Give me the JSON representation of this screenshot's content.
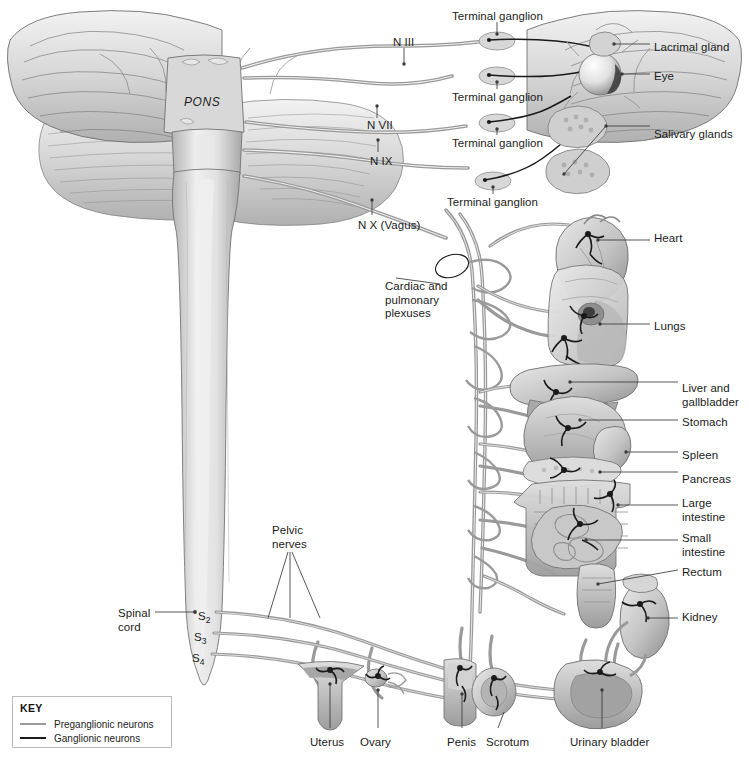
{
  "figure": {
    "background": "#ffffff"
  },
  "brain": {
    "pons_label": "PONS"
  },
  "cranial_nerves": [
    {
      "label": "N III",
      "x": 393,
      "y": 36,
      "tick": "down"
    },
    {
      "label": "N VII",
      "x": 367,
      "y": 119,
      "tick": "up"
    },
    {
      "label": "N IX",
      "x": 370,
      "y": 155,
      "tick": "up"
    },
    {
      "label": "N X (Vagus)",
      "x": 358,
      "y": 219,
      "tick": "up"
    }
  ],
  "ganglion_labels": [
    {
      "label": "Terminal ganglion",
      "x": 452,
      "y": 10,
      "tick": "down"
    },
    {
      "label": "Terminal ganglion",
      "x": 452,
      "y": 91,
      "tick": "up"
    },
    {
      "label": "Terminal ganglion",
      "x": 452,
      "y": 137,
      "tick": "up"
    },
    {
      "label": "Terminal ganglion",
      "x": 447,
      "y": 196,
      "tick": "up"
    }
  ],
  "left_annotations": [
    {
      "name": "cardiac-pulmonary-plexuses",
      "lines": [
        "Cardiac and",
        "pulmonary",
        "plexuses"
      ],
      "x": 385,
      "y": 280
    },
    {
      "name": "pelvic-nerves",
      "lines": [
        "Pelvic",
        "nerves"
      ],
      "x": 272,
      "y": 524
    },
    {
      "name": "spinal-cord",
      "lines": [
        "Spinal",
        "cord"
      ],
      "x": 118,
      "y": 607
    }
  ],
  "spinal_segments": [
    {
      "label": "S",
      "sub": "2",
      "x": 198,
      "y": 610
    },
    {
      "label": "S",
      "sub": "3",
      "x": 194,
      "y": 631
    },
    {
      "label": "S",
      "sub": "4",
      "x": 192,
      "y": 652
    }
  ],
  "organ_labels": [
    {
      "name": "lacrimal-gland",
      "lines": [
        "Lacrimal gland"
      ],
      "x": 654,
      "y": 41
    },
    {
      "name": "eye",
      "lines": [
        "Eye"
      ],
      "x": 654,
      "y": 70
    },
    {
      "name": "salivary-glands",
      "lines": [
        "Salivary glands"
      ],
      "x": 654,
      "y": 128
    },
    {
      "name": "heart",
      "lines": [
        "Heart"
      ],
      "x": 654,
      "y": 232
    },
    {
      "name": "lungs",
      "lines": [
        "Lungs"
      ],
      "x": 654,
      "y": 320
    },
    {
      "name": "liver-gallbladder",
      "lines": [
        "Liver and",
        "gallbladder"
      ],
      "x": 682,
      "y": 382
    },
    {
      "name": "stomach",
      "lines": [
        "Stomach"
      ],
      "x": 682,
      "y": 416
    },
    {
      "name": "spleen",
      "lines": [
        "Spleen"
      ],
      "x": 682,
      "y": 449
    },
    {
      "name": "pancreas",
      "lines": [
        "Pancreas"
      ],
      "x": 682,
      "y": 473
    },
    {
      "name": "large-intestine",
      "lines": [
        "Large",
        "intestine"
      ],
      "x": 682,
      "y": 497
    },
    {
      "name": "small-intestine",
      "lines": [
        "Small",
        "intestine"
      ],
      "x": 682,
      "y": 532
    },
    {
      "name": "rectum",
      "lines": [
        "Rectum"
      ],
      "x": 682,
      "y": 566
    },
    {
      "name": "kidney",
      "lines": [
        "Kidney"
      ],
      "x": 682,
      "y": 611
    }
  ],
  "bottom_labels": [
    {
      "name": "uterus",
      "label": "Uterus",
      "x": 310,
      "y": 736
    },
    {
      "name": "ovary",
      "label": "Ovary",
      "x": 360,
      "y": 736
    },
    {
      "name": "penis",
      "label": "Penis",
      "x": 447,
      "y": 736
    },
    {
      "name": "scrotum",
      "label": "Scrotum",
      "x": 486,
      "y": 736
    },
    {
      "name": "urinary-bladder",
      "label": "Urinary bladder",
      "x": 570,
      "y": 736
    }
  ],
  "key": {
    "title": "KEY",
    "entries": [
      {
        "label": "Preganglionic neurons",
        "color": "#9a9a9a"
      },
      {
        "label": "Ganglionic neurons",
        "color": "#1a1a1a"
      }
    ]
  },
  "colors": {
    "leader_line": "#3a3a3a",
    "preganglionic": "#9a9a9a",
    "ganglionic": "#1a1a1a",
    "tissue_light": "#e3e3e3",
    "tissue_mid": "#c2c2c2",
    "tissue_dark": "#9b9b9b",
    "outline": "#6f6f6f",
    "text": "#1c1c1c"
  }
}
